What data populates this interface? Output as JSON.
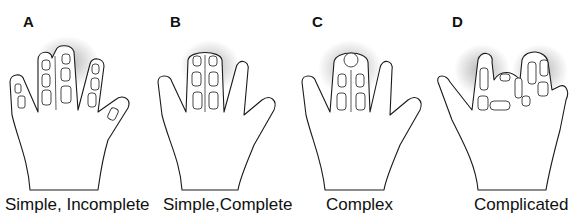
{
  "figure": {
    "panels": [
      {
        "letter": "A",
        "caption": "Simple, Incomplete"
      },
      {
        "letter": "B",
        "caption": "Simple,Complete"
      },
      {
        "letter": "C",
        "caption": "Complex"
      },
      {
        "letter": "D",
        "caption": "Complicated"
      }
    ]
  }
}
